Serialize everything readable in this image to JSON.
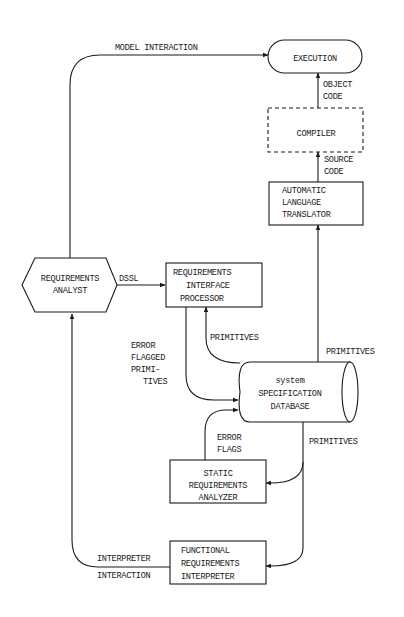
{
  "diagram": {
    "nodes": {
      "execution": {
        "label": "EXECUTION"
      },
      "compiler": {
        "label": "COMPILER"
      },
      "translator": {
        "lines": [
          "AUTOMATIC",
          "LANGUAGE",
          "TRANSLATOR"
        ]
      },
      "analyst": {
        "lines": [
          "REQUIREMENTS",
          "ANALYST"
        ]
      },
      "interface_processor": {
        "lines": [
          "REQUIREMENTS",
          "INTERFACE",
          "PROCESSOR"
        ]
      },
      "database": {
        "lines": [
          "system",
          "SPECIFICATION",
          "DATABASE"
        ]
      },
      "static_analyzer": {
        "lines": [
          "STATIC",
          "REQUIREMENTS",
          "ANALYZER"
        ]
      },
      "functional_interpreter": {
        "lines": [
          "FUNCTIONAL",
          "REQUIREMENTS",
          "INTERPRETER"
        ]
      }
    },
    "edges": {
      "model_interaction": "MODEL INTERACTION",
      "object_code": [
        "OBJECT",
        "CODE"
      ],
      "source_code": [
        "SOURCE",
        "CODE"
      ],
      "dssl": "DSSL",
      "primitives_to_processor": "PRIMITIVES",
      "error_flagged_primitives": [
        "ERROR",
        "FLAGGED",
        "PRIMI-",
        "TIVES"
      ],
      "primitives_to_translator": "PRIMITIVES",
      "error_flags": [
        "ERROR",
        "FLAGS"
      ],
      "primitives_to_analyzers": "PRIMITIVES",
      "interpreter_interaction": [
        "INTERPRETER",
        "INTERACTION"
      ]
    }
  }
}
